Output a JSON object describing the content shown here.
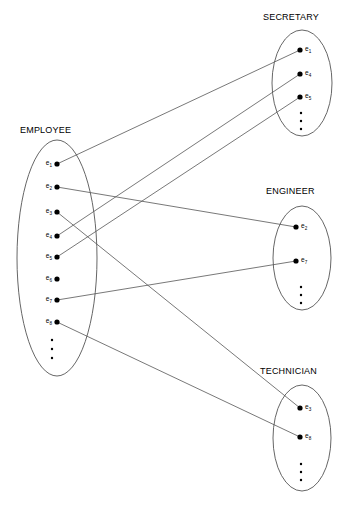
{
  "figure": {
    "kind": "set-membership-diagram",
    "background_color": "#ffffff",
    "outline_color": "#555555",
    "dot_color": "#000000",
    "text_color": "#000000"
  },
  "sets": [
    {
      "id": "employee",
      "title": "EMPLOYEE",
      "title_x": 20,
      "title_y": 133,
      "cx": 57,
      "cy": 258,
      "rx": 40,
      "ry": 118,
      "label_side": "left",
      "members": [
        {
          "id": "e1",
          "base": "e",
          "sub": "1",
          "x": 57,
          "y": 164
        },
        {
          "id": "e2",
          "base": "e",
          "sub": "2",
          "x": 57,
          "y": 187
        },
        {
          "id": "e3",
          "base": "e",
          "sub": "3",
          "x": 57,
          "y": 212
        },
        {
          "id": "e4",
          "base": "e",
          "sub": "4",
          "x": 57,
          "y": 236
        },
        {
          "id": "e5",
          "base": "e",
          "sub": "5",
          "x": 57,
          "y": 257
        },
        {
          "id": "e6",
          "base": "e",
          "sub": "6",
          "x": 57,
          "y": 279
        },
        {
          "id": "e7",
          "base": "e",
          "sub": "7",
          "x": 57,
          "y": 300
        },
        {
          "id": "e8",
          "base": "e",
          "sub": "8",
          "x": 57,
          "y": 322
        }
      ],
      "ellipsis": {
        "x": 52,
        "y": 340,
        "count": 3,
        "spacing": 9
      }
    },
    {
      "id": "secretary",
      "title": "SECRETARY",
      "title_x": 263,
      "title_y": 20,
      "cx": 302,
      "cy": 83,
      "rx": 30,
      "ry": 53,
      "label_side": "right",
      "members": [
        {
          "id": "s_e1",
          "base": "e",
          "sub": "1",
          "x": 300,
          "y": 50
        },
        {
          "id": "s_e4",
          "base": "e",
          "sub": "4",
          "x": 300,
          "y": 74
        },
        {
          "id": "s_e5",
          "base": "e",
          "sub": "5",
          "x": 300,
          "y": 97
        },
        {
          "id": "s_ell",
          "base": "",
          "sub": "",
          "x": 0,
          "y": 0
        }
      ],
      "ellipsis": {
        "x": 301,
        "y": 113,
        "count": 3,
        "spacing": 8
      }
    },
    {
      "id": "engineer",
      "title": "ENGINEER",
      "title_x": 266,
      "title_y": 194,
      "cx": 302,
      "cy": 258,
      "rx": 29,
      "ry": 52,
      "label_side": "right",
      "members": [
        {
          "id": "n_e2",
          "base": "e",
          "sub": "2",
          "x": 296,
          "y": 227
        },
        {
          "id": "n_e7",
          "base": "e",
          "sub": "7",
          "x": 296,
          "y": 261
        }
      ],
      "ellipsis": {
        "x": 301,
        "y": 287,
        "count": 3,
        "spacing": 8
      }
    },
    {
      "id": "technician",
      "title": "TECHNICIAN",
      "title_x": 260,
      "title_y": 374,
      "cx": 302,
      "cy": 438,
      "rx": 29,
      "ry": 53,
      "label_side": "right",
      "members": [
        {
          "id": "t_e3",
          "base": "e",
          "sub": "3",
          "x": 300,
          "y": 408
        },
        {
          "id": "t_e8",
          "base": "e",
          "sub": "8",
          "x": 300,
          "y": 437
        }
      ],
      "ellipsis": {
        "x": 301,
        "y": 464,
        "count": 3,
        "spacing": 8
      }
    }
  ],
  "edges": [
    {
      "id": "edge-e1-secretary",
      "from": "e1",
      "to": "s_e1",
      "x1": 57,
      "y1": 164,
      "x2": 300,
      "y2": 50
    },
    {
      "id": "edge-e4-secretary",
      "from": "e4",
      "to": "s_e4",
      "x1": 57,
      "y1": 236,
      "x2": 300,
      "y2": 74
    },
    {
      "id": "edge-e5-secretary",
      "from": "e5",
      "to": "s_e5",
      "x1": 57,
      "y1": 257,
      "x2": 300,
      "y2": 97
    },
    {
      "id": "edge-e2-engineer",
      "from": "e2",
      "to": "n_e2",
      "x1": 57,
      "y1": 187,
      "x2": 296,
      "y2": 227
    },
    {
      "id": "edge-e7-engineer",
      "from": "e7",
      "to": "n_e7",
      "x1": 57,
      "y1": 300,
      "x2": 296,
      "y2": 261
    },
    {
      "id": "edge-e3-technician",
      "from": "e3",
      "to": "t_e3",
      "x1": 57,
      "y1": 212,
      "x2": 300,
      "y2": 408
    },
    {
      "id": "edge-e8-technician",
      "from": "e8",
      "to": "t_e8",
      "x1": 57,
      "y1": 322,
      "x2": 300,
      "y2": 437
    }
  ]
}
